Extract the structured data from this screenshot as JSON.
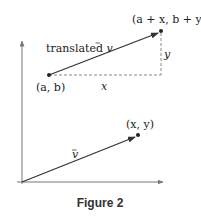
{
  "figure": {
    "caption": "Figure 2",
    "labels": {
      "translated_vector": "translated v⃗",
      "translated_prefix": "translated ",
      "vector_symbol": "v",
      "start_point": "(a, b)",
      "end_point": "(a + x, b + y)",
      "x_component": "x",
      "y_component": "y",
      "vector_label": "v",
      "tip_point": "(x, y)"
    },
    "colors": {
      "axis": "#777777",
      "vector": "#333333",
      "dashed": "#888888"
    }
  }
}
